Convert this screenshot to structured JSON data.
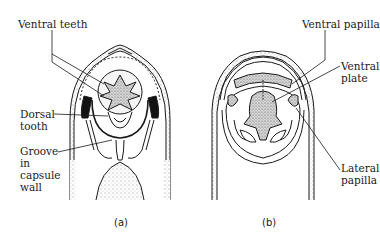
{
  "figure": {
    "panels": [
      {
        "id": "a",
        "caption": "(a)",
        "labels": {
          "ventral_teeth": "Ventral teeth",
          "dorsal_tooth": [
            "Dorsal",
            "tooth"
          ],
          "groove": [
            "Groove",
            "in",
            "capsule",
            "wall"
          ]
        }
      },
      {
        "id": "b",
        "caption": "(b)",
        "labels": {
          "ventral_papilla": "Ventral papilla",
          "ventral_plate": [
            "Ventral",
            "plate"
          ],
          "lateral_papilla": [
            "Lateral",
            "papilla"
          ]
        }
      }
    ],
    "colors": {
      "ink": "#1a1a1a",
      "stipple": "#9a9a9a",
      "background": "#ffffff"
    }
  }
}
